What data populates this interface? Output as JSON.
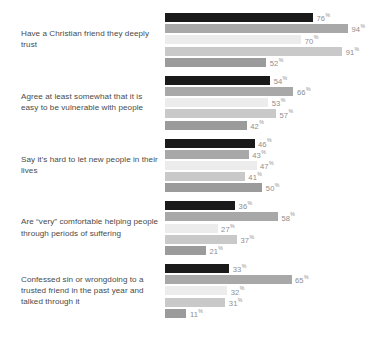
{
  "chart_data": {
    "type": "bar",
    "orientation": "horizontal",
    "grouped": true,
    "title": "",
    "subtitle": "",
    "xlabel": "",
    "ylabel": "",
    "xlim": [
      0,
      100
    ],
    "grid": false,
    "legend_position": "none",
    "value_suffix": "%",
    "categories": [
      "Have a Christian friend they deeply trust",
      "Agree at least somewhat that it is easy to be vulnerable with people",
      "Say it’s hard to let new people in their lives",
      "Are “very” comfortable helping people through periods of suffering",
      "Confessed sin or wrongdoing to a trusted friend in the past year and talked through it"
    ],
    "series": [
      {
        "name": "series-1",
        "color": "#1a1a1a",
        "values": [
          76,
          54,
          46,
          36,
          33
        ]
      },
      {
        "name": "series-2",
        "color": "#a8a8a8",
        "values": [
          94,
          66,
          43,
          58,
          65
        ]
      },
      {
        "name": "series-3",
        "color": "#ececec",
        "values": [
          70,
          53,
          47,
          27,
          32
        ]
      },
      {
        "name": "series-4",
        "color": "#c9c9c9",
        "values": [
          91,
          57,
          41,
          37,
          31
        ]
      },
      {
        "name": "series-5",
        "color": "#9b9b9b",
        "values": [
          52,
          42,
          50,
          21,
          11
        ]
      }
    ],
    "groups": [
      {
        "label": "Have a Christian friend they deeply trust",
        "bars": [
          {
            "series": "series-1",
            "value": 76,
            "label": "76",
            "suffix": "%",
            "color": "#1a1a1a"
          },
          {
            "series": "series-2",
            "value": 94,
            "label": "94",
            "suffix": "%",
            "color": "#a8a8a8"
          },
          {
            "series": "series-3",
            "value": 70,
            "label": "70",
            "suffix": "%",
            "color": "#ececec"
          },
          {
            "series": "series-4",
            "value": 91,
            "label": "91",
            "suffix": "%",
            "color": "#c9c9c9"
          },
          {
            "series": "series-5",
            "value": 52,
            "label": "52",
            "suffix": "%",
            "color": "#9b9b9b"
          }
        ]
      },
      {
        "label": "Agree at least somewhat that it is easy to be vulnerable with people",
        "bars": [
          {
            "series": "series-1",
            "value": 54,
            "label": "54",
            "suffix": "%",
            "color": "#1a1a1a"
          },
          {
            "series": "series-2",
            "value": 66,
            "label": "66",
            "suffix": "%",
            "color": "#a8a8a8"
          },
          {
            "series": "series-3",
            "value": 53,
            "label": "53",
            "suffix": "%",
            "color": "#ececec"
          },
          {
            "series": "series-4",
            "value": 57,
            "label": "57",
            "suffix": "%",
            "color": "#c9c9c9"
          },
          {
            "series": "series-5",
            "value": 42,
            "label": "42",
            "suffix": "%",
            "color": "#9b9b9b"
          }
        ]
      },
      {
        "label": "Say it’s hard to let new people in their lives",
        "bars": [
          {
            "series": "series-1",
            "value": 46,
            "label": "46",
            "suffix": "%",
            "color": "#1a1a1a"
          },
          {
            "series": "series-2",
            "value": 43,
            "label": "43",
            "suffix": "%",
            "color": "#a8a8a8"
          },
          {
            "series": "series-3",
            "value": 47,
            "label": "47",
            "suffix": "%",
            "color": "#ececec"
          },
          {
            "series": "series-4",
            "value": 41,
            "label": "41",
            "suffix": "%",
            "color": "#c9c9c9"
          },
          {
            "series": "series-5",
            "value": 50,
            "label": "50",
            "suffix": "%",
            "color": "#9b9b9b"
          }
        ]
      },
      {
        "label": "Are “very” comfortable helping people through periods of suffering",
        "bars": [
          {
            "series": "series-1",
            "value": 36,
            "label": "36",
            "suffix": "%",
            "color": "#1a1a1a"
          },
          {
            "series": "series-2",
            "value": 58,
            "label": "58",
            "suffix": "%",
            "color": "#a8a8a8"
          },
          {
            "series": "series-3",
            "value": 27,
            "label": "27",
            "suffix": "%",
            "color": "#ececec"
          },
          {
            "series": "series-4",
            "value": 37,
            "label": "37",
            "suffix": "%",
            "color": "#c9c9c9"
          },
          {
            "series": "series-5",
            "value": 21,
            "label": "21",
            "suffix": "%",
            "color": "#9b9b9b"
          }
        ]
      },
      {
        "label": "Confessed sin or wrongdoing to a trusted friend in the past year and talked through it",
        "bars": [
          {
            "series": "series-1",
            "value": 33,
            "label": "33",
            "suffix": "%",
            "color": "#1a1a1a"
          },
          {
            "series": "series-2",
            "value": 65,
            "label": "65",
            "suffix": "%",
            "color": "#a8a8a8"
          },
          {
            "series": "series-3",
            "value": 32,
            "label": "32",
            "suffix": "%",
            "color": "#ececec"
          },
          {
            "series": "series-4",
            "value": 31,
            "label": "31",
            "suffix": "%",
            "color": "#c9c9c9"
          },
          {
            "series": "series-5",
            "value": 11,
            "label": "11",
            "suffix": "%",
            "color": "#9b9b9b"
          }
        ]
      }
    ]
  },
  "render": {
    "bar_track_px": 183,
    "bar_scale_max": 94
  }
}
